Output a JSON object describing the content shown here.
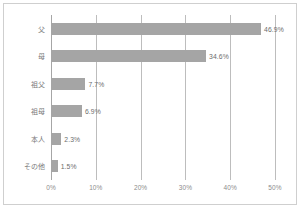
{
  "chart_data": {
    "type": "bar",
    "orientation": "horizontal",
    "title": "",
    "subtitle": "",
    "xlabel": "",
    "ylabel": "",
    "categories": [
      "父",
      "母",
      "祖父",
      "祖母",
      "本人",
      "その他"
    ],
    "values": [
      46.9,
      34.6,
      7.7,
      6.9,
      2.3,
      1.5
    ],
    "data_labels": [
      "46.9%",
      "34.6%",
      "7.7%",
      "6.9%",
      "2.3%",
      "1.5%"
    ],
    "xlim": [
      0,
      50
    ],
    "xticks": [
      0,
      10,
      20,
      30,
      40,
      50
    ],
    "xtick_labels": [
      "0%",
      "10%",
      "20%",
      "30%",
      "40%",
      "50%"
    ],
    "grid": "vertical",
    "legend": "none",
    "series": [
      {
        "name": "",
        "values": [
          46.9,
          34.6,
          7.7,
          6.9,
          2.3,
          1.5
        ]
      }
    ],
    "colors": {
      "bar": "#a5a5a5",
      "gridline": "#bdbdbd",
      "axis": "#a6a6a6",
      "frame": "#cfcfcf",
      "tick_text": "#8c8c8c",
      "value_text": "#6d6d6d",
      "category_text": "#7a7a7a",
      "background": "#ffffff"
    }
  }
}
